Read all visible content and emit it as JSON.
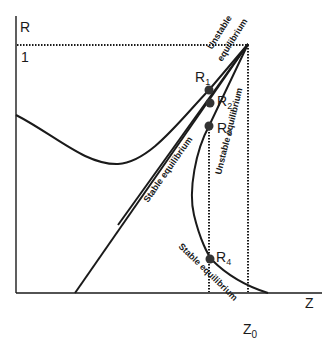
{
  "axes": {
    "y_label": "R",
    "x_label": "Z",
    "y_tick_one": "1",
    "x_mark": "Z",
    "x_mark_sub": "0"
  },
  "points": [
    {
      "label": "R",
      "sub": "1"
    },
    {
      "label": "R",
      "sub": "2"
    },
    {
      "label": "R",
      "sub": "3"
    },
    {
      "label": "R",
      "sub": "4"
    }
  ],
  "annotations": {
    "top_unstable_line1": "Unstable",
    "top_unstable_line2": "equilibrium",
    "stable_diagonal": "Stable equilibrium",
    "right_unstable": "Unstable equilibrium",
    "lower_stable": "Stable equilibrium"
  },
  "colors": {
    "ink": "#1a1a1a",
    "point": "#333333"
  }
}
